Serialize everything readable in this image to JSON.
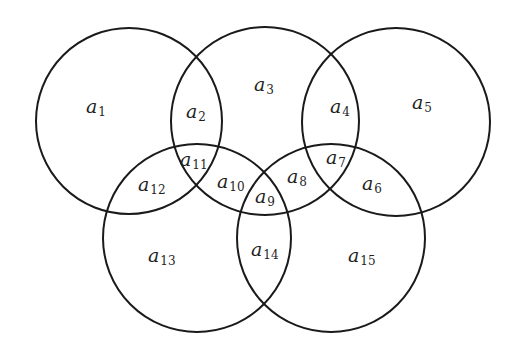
{
  "diagram": {
    "type": "venn",
    "stroke_color": "#1a1a1a",
    "background": "#ffffff",
    "circles": [
      {
        "id": "C1",
        "cx": 129,
        "cy": 121,
        "r": 93
      },
      {
        "id": "C2",
        "cx": 265,
        "cy": 121,
        "r": 94
      },
      {
        "id": "C3",
        "cx": 396,
        "cy": 122,
        "r": 94
      },
      {
        "id": "C4",
        "cx": 197,
        "cy": 238,
        "r": 94
      },
      {
        "id": "C5",
        "cx": 331,
        "cy": 238,
        "r": 94
      }
    ],
    "regions": [
      {
        "base": "a",
        "sub": "1",
        "x": 86,
        "y": 113
      },
      {
        "base": "a",
        "sub": "2",
        "x": 186,
        "y": 118
      },
      {
        "base": "a",
        "sub": "3",
        "x": 254,
        "y": 91
      },
      {
        "base": "a",
        "sub": "4",
        "x": 330,
        "y": 113
      },
      {
        "base": "a",
        "sub": "5",
        "x": 412,
        "y": 109
      },
      {
        "base": "a",
        "sub": "6",
        "x": 362,
        "y": 190
      },
      {
        "base": "a",
        "sub": "7",
        "x": 326,
        "y": 164
      },
      {
        "base": "a",
        "sub": "8",
        "x": 287,
        "y": 183
      },
      {
        "base": "a",
        "sub": "9",
        "x": 255,
        "y": 203
      },
      {
        "base": "a",
        "sub": "10",
        "x": 217,
        "y": 188
      },
      {
        "base": "a",
        "sub": "11",
        "x": 180,
        "y": 166
      },
      {
        "base": "a",
        "sub": "12",
        "x": 138,
        "y": 191
      },
      {
        "base": "a",
        "sub": "13",
        "x": 148,
        "y": 262
      },
      {
        "base": "a",
        "sub": "14",
        "x": 251,
        "y": 256
      },
      {
        "base": "a",
        "sub": "15",
        "x": 348,
        "y": 262
      }
    ]
  }
}
